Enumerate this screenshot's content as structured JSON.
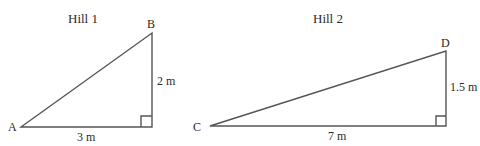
{
  "diagram": {
    "hill1": {
      "title": "Hill 1",
      "vertices": {
        "A": {
          "label": "A",
          "x": 21,
          "y": 127
        },
        "B": {
          "label": "B",
          "x": 152,
          "y": 33
        },
        "right_angle": {
          "x": 152,
          "y": 127
        }
      },
      "base_label": "3 m",
      "height_label": "2 m"
    },
    "hill2": {
      "title": "Hill 2",
      "vertices": {
        "C": {
          "label": "C",
          "x": 210,
          "y": 126
        },
        "D": {
          "label": "D",
          "x": 446,
          "y": 51
        },
        "right_angle": {
          "x": 446,
          "y": 126
        }
      },
      "base_label": "7 m",
      "height_label": "1.5 m"
    },
    "colors": {
      "stroke": "#555555",
      "text": "#2a2a2a",
      "background": "#ffffff"
    }
  }
}
